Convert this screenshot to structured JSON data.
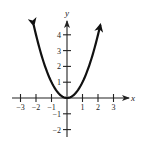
{
  "chart_data": {
    "type": "line",
    "title": "",
    "function": "y = x^2",
    "xlabel": "x",
    "ylabel": "y",
    "xlim": [
      -3.4,
      3.8
    ],
    "ylim": [
      -2.4,
      4.8
    ],
    "x_ticks": [
      -3,
      -2,
      -1,
      1,
      2,
      3
    ],
    "y_ticks": [
      -2,
      -1,
      1,
      2,
      3,
      4
    ],
    "x_tick_labels": [
      "−3",
      "−2",
      "−1",
      "1",
      "2",
      "3"
    ],
    "y_tick_labels": [
      "−2",
      "−1",
      "1",
      "2",
      "3",
      "4"
    ],
    "grid": false,
    "legend": null,
    "series": [
      {
        "name": "y = x^2",
        "x": [
          -2.15,
          -2,
          -1.5,
          -1,
          -0.5,
          0,
          0.5,
          1,
          1.5,
          2,
          2.15
        ],
        "y": [
          4.62,
          4,
          2.25,
          1,
          0.25,
          0,
          0.25,
          1,
          2.25,
          4,
          4.62
        ],
        "arrows_at_ends": true,
        "color": "#111111"
      }
    ]
  },
  "axes": {
    "x_label": "x",
    "y_label": "y"
  },
  "colors": {
    "curve": "#111111",
    "axes": "#222222",
    "background": "#ffffff"
  }
}
